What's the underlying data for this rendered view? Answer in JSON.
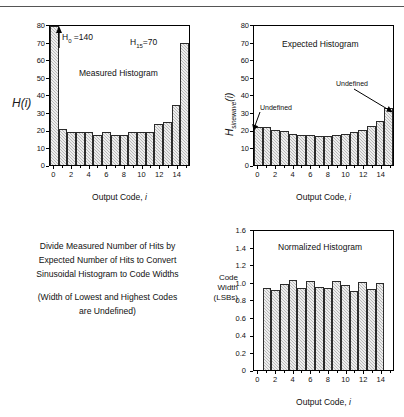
{
  "figure": {
    "divider": "top-rule"
  },
  "chart_data": [
    {
      "id": "measured",
      "type": "bar",
      "title": "Measured Histogram",
      "xlabel": "Output Code, i",
      "ylabel": "H(i)",
      "categories": [
        0,
        1,
        2,
        3,
        4,
        5,
        6,
        7,
        8,
        9,
        10,
        11,
        12,
        13,
        14,
        15
      ],
      "values": [
        140,
        21,
        19,
        19,
        19,
        17.5,
        19,
        17.5,
        17.5,
        19,
        19,
        19,
        23.5,
        25,
        34.5,
        70
      ],
      "ylim": [
        0,
        80
      ],
      "yticks": [
        0,
        10,
        20,
        30,
        40,
        50,
        60,
        70,
        80
      ],
      "xticks": [
        0,
        2,
        4,
        6,
        8,
        10,
        12,
        14
      ],
      "grid": false,
      "annotations": [
        {
          "name": "h0-label",
          "text": "H0 =140",
          "sub": "0",
          "base": "H",
          "rest": " =140"
        },
        {
          "name": "h15-label",
          "text": "H15=70",
          "sub": "15",
          "base": "H",
          "rest": "=70"
        }
      ]
    },
    {
      "id": "expected",
      "type": "bar",
      "title": "Expected Histogram",
      "xlabel": "Output Code, i",
      "ylabel": "Hsinewave(i)",
      "ylabel_base": "H",
      "ylabel_sub": "sinewave",
      "ylabel_arg": "(i)",
      "categories": [
        0,
        1,
        2,
        3,
        4,
        5,
        6,
        7,
        8,
        9,
        10,
        11,
        12,
        13,
        14,
        15
      ],
      "values": [
        22,
        22,
        20.3,
        19.4,
        18,
        17.5,
        17,
        16.8,
        16.7,
        17,
        18,
        19,
        20.3,
        22.2,
        25.6,
        33
      ],
      "ylim": [
        0,
        80
      ],
      "yticks": [
        0,
        10,
        20,
        30,
        40,
        50,
        60,
        70,
        80
      ],
      "xticks": [
        0,
        2,
        4,
        6,
        8,
        10,
        12,
        14
      ],
      "grid": false,
      "annotations": [
        {
          "name": "undefined-left",
          "text": "Undefined"
        },
        {
          "name": "undefined-right",
          "text": "Undefined"
        }
      ]
    },
    {
      "id": "normalized",
      "type": "bar",
      "title": "Normalized Histogram",
      "xlabel": "Output Code, i",
      "ylabel": "Code Width (LSBs)",
      "ylabel_lines": [
        "Code",
        "Width",
        "(LSBs)"
      ],
      "categories": [
        1,
        2,
        3,
        4,
        5,
        6,
        7,
        8,
        9,
        10,
        11,
        12,
        13,
        14
      ],
      "values": [
        0.945,
        0.925,
        0.99,
        1.04,
        0.945,
        1.025,
        0.96,
        0.945,
        1.025,
        0.98,
        0.91,
        1.01,
        0.935,
        1.0
      ],
      "ylim": [
        0,
        1.6
      ],
      "yticks": [
        "0",
        "0.2",
        "0.4",
        "0.6",
        "0.8",
        "1.0",
        "1.2",
        "1.4",
        "1.6"
      ],
      "ytick_values": [
        0,
        0.2,
        0.4,
        0.6,
        0.8,
        1.0,
        1.2,
        1.4,
        1.6
      ],
      "xticks": [
        0,
        2,
        4,
        6,
        8,
        10,
        12,
        14
      ],
      "grid": false
    }
  ],
  "caption": {
    "lines": [
      "Divide Measured Number of Hits by",
      "Expected Number of Hits to Convert",
      "Sinusoidal Histogram to Code Widths"
    ],
    "lines2": [
      "(Width of Lowest and Highest Codes",
      "are Undefined)"
    ]
  }
}
